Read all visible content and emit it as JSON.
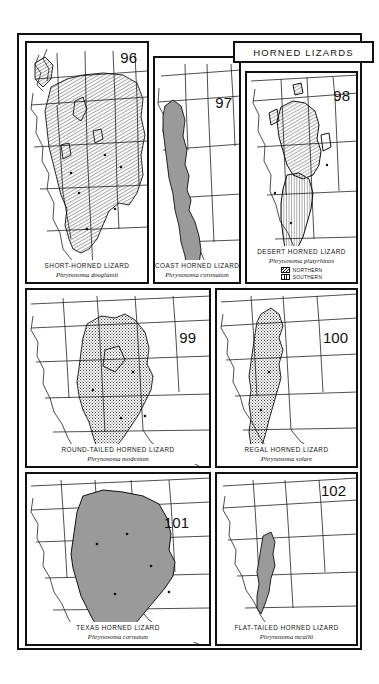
{
  "plate": {
    "title": "HORNED LIZARDS",
    "genus_italic": true
  },
  "legend": {
    "northern_label": "NORTHERN",
    "southern_label": "SOUTHERN",
    "northern_pattern": "diagonal-hatch",
    "southern_pattern": "vertical-hatch"
  },
  "colors": {
    "ink": "#111111",
    "paper": "#ffffff",
    "range_fill_gray": "#9a9a9a",
    "range_fill_light": "#c9c9c9",
    "state_line": "#333333"
  },
  "panels": [
    {
      "number": "96",
      "common_name": "SHORT-HORNED LIZARD",
      "scientific_name": "Phrynosoma douglassii",
      "range_pattern": "diagonal-hatch",
      "region": "western-united-states"
    },
    {
      "number": "97",
      "common_name": "COAST HORNED LIZARD",
      "scientific_name": "Phrynosoma coronatum",
      "range_pattern": "solid-gray",
      "region": "california-coast-and-baja"
    },
    {
      "number": "98",
      "common_name": "DESERT HORNED LIZARD",
      "scientific_name": "Phrynosoma platyrhinos",
      "range_pattern": "two-tone-hatch",
      "region": "great-basin-and-mojave",
      "has_legend": true
    },
    {
      "number": "99",
      "common_name": "ROUND-TAILED HORNED LIZARD",
      "scientific_name": "Phrynosoma modestum",
      "range_pattern": "stipple",
      "region": "chihuahuan-desert"
    },
    {
      "number": "100",
      "common_name": "REGAL HORNED LIZARD",
      "scientific_name": "Phrynosoma solare",
      "range_pattern": "stipple",
      "region": "sonoran-desert"
    },
    {
      "number": "101",
      "common_name": "TEXAS HORNED LIZARD",
      "scientific_name": "Phrynosoma cornutum",
      "range_pattern": "solid-gray",
      "region": "southern-great-plains-and-texas"
    },
    {
      "number": "102",
      "common_name": "FLAT-TAILED HORNED LIZARD",
      "scientific_name": "Phrynosoma mcallii",
      "range_pattern": "solid-gray",
      "region": "colorado-desert"
    }
  ]
}
